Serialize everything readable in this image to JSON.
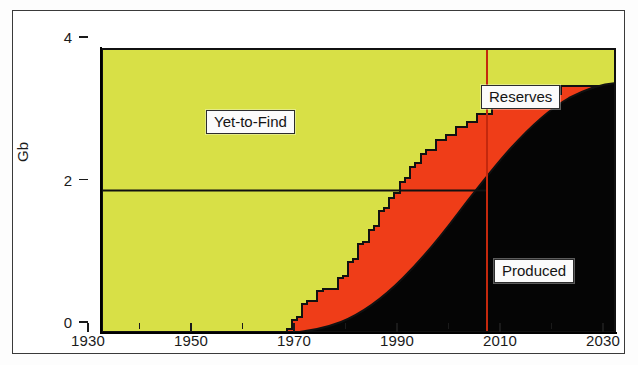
{
  "figure": {
    "background": "#ffffff",
    "frame_color": "#3a3a3a"
  },
  "axes": {
    "y_title": "Gb",
    "y_ticks": [
      0,
      2,
      4
    ],
    "y_tick_labels": [
      "0",
      "2",
      "4"
    ],
    "ylim": [
      0,
      4
    ],
    "x_major_ticks": [
      1930,
      1950,
      1970,
      1990,
      2010,
      2030
    ],
    "x_major_labels": [
      "1930",
      "1950",
      "1970",
      "1990",
      "2010",
      "2030"
    ],
    "x_minor_ticks": [
      1940,
      1960,
      1980,
      2000,
      2020
    ],
    "xlim": [
      1930,
      2030
    ]
  },
  "labels": {
    "yet_to_find": "Yet-to-Find",
    "reserves": "Reserves",
    "produced": "Produced"
  },
  "colors": {
    "yet_to_find": "#d8e046",
    "reserves": "#ef3d18",
    "produced": "#050505",
    "marker_line": "#c4280d",
    "outline": "#111111"
  },
  "markers": {
    "current_year_line": 2008,
    "reference_level_line": 2
  },
  "chart_data": {
    "type": "area",
    "title": "",
    "xlabel": "",
    "ylabel": "Gb",
    "xlim": [
      1930,
      2030
    ],
    "ylim": [
      0,
      4
    ],
    "grid": false,
    "legend": "inline-callouts",
    "stacking": "cumulative-to-total",
    "total_constant": 4,
    "annotations": [
      {
        "text": "Yet-to-Find",
        "x": 1953,
        "y": 3.1
      },
      {
        "text": "Reserves",
        "x": 2006,
        "y": 3.4
      },
      {
        "text": "Produced",
        "x": 2018,
        "y": 1.05
      },
      {
        "text": "vertical marker at 2008",
        "x": 2008,
        "y": 2.0
      },
      {
        "text": "horizontal reference at 2 Gb",
        "x": 1930,
        "y": 2.0
      }
    ],
    "series": [
      {
        "name": "Produced",
        "color": "#050505",
        "x": [
          1930,
          1940,
          1950,
          1955,
          1960,
          1965,
          1968,
          1970,
          1972,
          1974,
          1976,
          1978,
          1980,
          1982,
          1984,
          1986,
          1988,
          1990,
          1992,
          1994,
          1996,
          1998,
          2000,
          2002,
          2004,
          2006,
          2008,
          2010,
          2012,
          2014,
          2016,
          2018,
          2020,
          2022,
          2024,
          2026,
          2028,
          2030
        ],
        "values": [
          0,
          0,
          0,
          0.01,
          0.02,
          0.03,
          0.04,
          0.05,
          0.07,
          0.09,
          0.12,
          0.15,
          0.19,
          0.24,
          0.3,
          0.37,
          0.45,
          0.55,
          0.66,
          0.79,
          0.93,
          1.09,
          1.26,
          1.45,
          1.65,
          1.84,
          2.0,
          2.2,
          2.45,
          2.7,
          2.95,
          3.2,
          3.42,
          3.6,
          3.75,
          3.87,
          3.95,
          4.0
        ]
      },
      {
        "name": "Produced + Reserves",
        "color": "#ef3d18",
        "x": [
          1930,
          1966,
          1967,
          1968,
          1969,
          1970,
          1971,
          1972,
          1974,
          1976,
          1978,
          1979,
          1980,
          1981,
          1982,
          1983,
          1984,
          1985,
          1986,
          1987,
          1988,
          1989,
          1990,
          1991,
          1992,
          1993,
          1994,
          1995,
          1996,
          1998,
          2000,
          2002,
          2004,
          2006,
          2008,
          2012,
          2016,
          2020,
          2030
        ],
        "values": [
          0,
          0,
          0.05,
          0.18,
          0.2,
          0.22,
          0.38,
          0.4,
          0.42,
          0.55,
          0.58,
          0.74,
          0.77,
          0.8,
          1.0,
          1.04,
          1.24,
          1.28,
          1.56,
          1.6,
          1.9,
          2.0,
          2.12,
          2.25,
          2.4,
          2.52,
          2.62,
          2.72,
          2.84,
          2.95,
          3.1,
          3.22,
          3.35,
          3.5,
          3.62,
          3.8,
          3.92,
          3.98,
          4.0
        ]
      },
      {
        "name": "Total (Produced + Reserves + Yet-to-Find)",
        "color": "#d8e046",
        "x": [
          1930,
          2030
        ],
        "values": [
          4,
          4
        ]
      }
    ]
  }
}
